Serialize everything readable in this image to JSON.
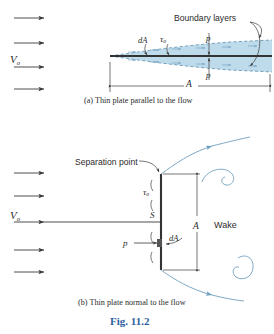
{
  "figure": {
    "number_label": "Fig. 11.2",
    "number_color": "#2f5f9e",
    "background": "#ffffff",
    "line_color": "#3a3a3a",
    "boundary_layer_fill": "#a8cfe4",
    "boundary_layer_stroke": "#5e93b5",
    "vortex_color": "#7fa9c6"
  },
  "panel_a": {
    "caption_prefix": "(a)",
    "caption": "(a) Thin plate parallel to the flow",
    "freestream_label": "V",
    "freestream_subscript": "o",
    "labels": {
      "boundary_layers": "Boundary layers",
      "area_element": "dA",
      "wall_shear": "τ",
      "wall_shear_subscript": "o",
      "pressure_top": "p",
      "pressure_bottom": "p",
      "area": "A"
    },
    "inflow_arrow_count": 4
  },
  "panel_b": {
    "caption_prefix": "(b)",
    "caption": "(b) Thin plate normal to the flow",
    "freestream_label": "V",
    "freestream_subscript": "o",
    "labels": {
      "separation_point": "Separation point",
      "wall_shear": "τ",
      "wall_shear_subscript": "o",
      "stagnation_point": "S",
      "area_element": "dA",
      "pressure": "p",
      "area": "A",
      "wake": "Wake"
    },
    "inflow_arrow_count": 5
  }
}
